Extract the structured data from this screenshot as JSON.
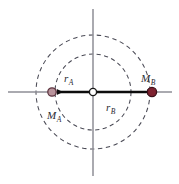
{
  "figure": {
    "kind": "two-body-barycenter-diagram",
    "width": 179,
    "height": 184,
    "background_color": "#ffffff"
  },
  "labels": {
    "r_a": {
      "base": "r",
      "sub": "A"
    },
    "r_b": {
      "base": "r",
      "sub": "B"
    },
    "m_a": {
      "base": "M",
      "sub": "A"
    },
    "m_b": {
      "base": "M",
      "sub": "B"
    }
  },
  "colors": {
    "axis": "#8e8e96",
    "dashed_circle": "#4a4a55",
    "arrow": "#0d0d0d",
    "mass_a_fill": "#b9949c",
    "mass_a_stroke": "#5d3540",
    "mass_b_fill": "#7e2230",
    "mass_b_stroke": "#3d1019",
    "origin_fill": "#ffffff",
    "origin_stroke": "#1a1a1a",
    "label_text": "#2a2a33"
  },
  "geometry": {
    "origin": {
      "x": 93,
      "y": 92
    },
    "axis_horizontal": {
      "x1": 8,
      "x2": 172,
      "y": 92
    },
    "axis_vertical": {
      "y1": 9,
      "y2": 176,
      "x": 93
    },
    "circles": [
      {
        "name": "inner-orbit",
        "radius": 38
      },
      {
        "name": "outer-orbit",
        "radius": 57
      }
    ],
    "mass_a": {
      "x": 52,
      "y": 92,
      "radius": 4.2
    },
    "mass_b": {
      "x": 152,
      "y": 92,
      "radius": 4.6
    },
    "origin_marker_radius": 3.6,
    "vector_a": {
      "from_x": 93,
      "to_x": 54,
      "y": 92,
      "direction": "left"
    },
    "vector_b": {
      "from_x": 93,
      "to_x": 150,
      "y": 92,
      "direction": "right"
    },
    "label_positions": {
      "r_a": {
        "x": 64,
        "y": 82
      },
      "r_b": {
        "x": 106,
        "y": 111
      },
      "m_a": {
        "x": 47,
        "y": 119
      },
      "m_b": {
        "x": 141,
        "y": 82
      }
    }
  }
}
